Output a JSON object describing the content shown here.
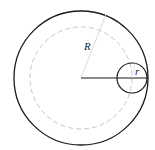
{
  "diagram": {
    "title": "",
    "labels": {
      "big_radius": "R",
      "small_radius": "r"
    },
    "colors": {
      "stroke": "#1a1a1a",
      "dashed": "#c8c8c8",
      "radius_line": "#d0d0d0",
      "background": "#ffffff"
    },
    "geometry": {
      "outer_circle": {
        "cx": 81,
        "cy": 78,
        "r": 67
      },
      "dashed_circle": {
        "cx": 81,
        "cy": 78,
        "r": 51
      },
      "small_circle": {
        "cx": 132,
        "cy": 78,
        "r": 15
      }
    }
  }
}
